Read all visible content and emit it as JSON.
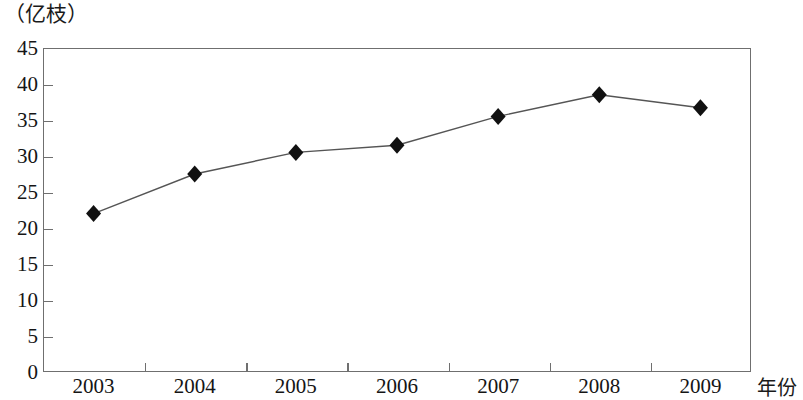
{
  "chart_data": {
    "type": "line",
    "title": "",
    "subtitle": "",
    "xlabel": "年份",
    "ylabel": "（亿枝）",
    "categories": [
      "2003",
      "2004",
      "2005",
      "2006",
      "2007",
      "2008",
      "2009"
    ],
    "values": [
      22.0,
      27.5,
      30.5,
      31.5,
      35.5,
      38.5,
      36.7
    ],
    "series": [
      {
        "name": "鲜切花产量",
        "values": [
          22.0,
          27.5,
          30.5,
          31.5,
          35.5,
          38.5,
          36.7
        ]
      }
    ],
    "ylim": [
      0,
      45
    ],
    "y_ticks": [
      0,
      5,
      10,
      15,
      20,
      25,
      30,
      35,
      40,
      45
    ],
    "y_tick_labels": [
      "0",
      "5",
      "10",
      "15",
      "20",
      "25",
      "30",
      "35",
      "40",
      "45"
    ],
    "x_tick_labels": [
      "2003",
      "2004",
      "2005",
      "2006",
      "2007",
      "2008",
      "2009"
    ],
    "grid": false,
    "legend": null,
    "legend_position": "none",
    "marker": "diamond",
    "marker_color": "#111111",
    "line_color": "#555555",
    "plot_border_color": "#6f6f6f",
    "background_color": "#ffffff",
    "annotations": []
  },
  "axes": {
    "y_unit_label": "（亿枝）",
    "x_axis_title": "年份"
  }
}
